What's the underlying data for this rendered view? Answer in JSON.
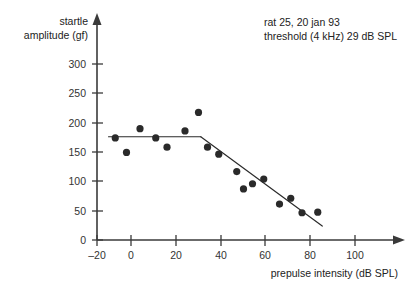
{
  "chart_data": {
    "type": "scatter",
    "title": "",
    "xlabel": "prepulse intensity (dB SPL)",
    "ylabel": "startle amplitude (gf)",
    "xlim": [
      -20,
      110
    ],
    "ylim": [
      0,
      320
    ],
    "xticks": [
      -20,
      0,
      20,
      40,
      60,
      80,
      100
    ],
    "xtick_labels": [
      "–20",
      "0",
      "20",
      "40",
      "60",
      "80",
      "100"
    ],
    "yticks": [
      0,
      50,
      100,
      150,
      200,
      250,
      300
    ],
    "ytick_labels": [
      "0",
      "50",
      "100",
      "150",
      "200",
      "250",
      "300"
    ],
    "grid": false,
    "legend": "none",
    "points": [
      {
        "x": -7,
        "y": 176
      },
      {
        "x": -2,
        "y": 151
      },
      {
        "x": 4,
        "y": 192
      },
      {
        "x": 11,
        "y": 176
      },
      {
        "x": 16,
        "y": 160
      },
      {
        "x": 24,
        "y": 188
      },
      {
        "x": 30,
        "y": 220
      },
      {
        "x": 34,
        "y": 160
      },
      {
        "x": 39,
        "y": 148
      },
      {
        "x": 47,
        "y": 118
      },
      {
        "x": 50,
        "y": 88
      },
      {
        "x": 54,
        "y": 97
      },
      {
        "x": 59,
        "y": 105
      },
      {
        "x": 66,
        "y": 62
      },
      {
        "x": 71,
        "y": 72
      },
      {
        "x": 76,
        "y": 47
      },
      {
        "x": 83,
        "y": 48
      }
    ],
    "fit_segments": [
      {
        "name": "plateau",
        "x1": -10,
        "y1": 178,
        "x2": 31,
        "y2": 178
      },
      {
        "name": "descending",
        "x1": 31,
        "y1": 178,
        "x2": 85,
        "y2": 24
      }
    ],
    "annotations": [
      {
        "name": "subject-line",
        "text": "rat 25, 20 jan 93",
        "x": 42,
        "y": 300
      },
      {
        "name": "threshold-line",
        "text": "threshold (4 kHz) 29 dB SPL",
        "x": 42,
        "y": 282
      }
    ]
  },
  "colors": {
    "axis": "#3a3a3a",
    "point": "#2a2a2a",
    "fit": "#2b2b2b",
    "text": "#222222",
    "background": "#ffffff"
  }
}
